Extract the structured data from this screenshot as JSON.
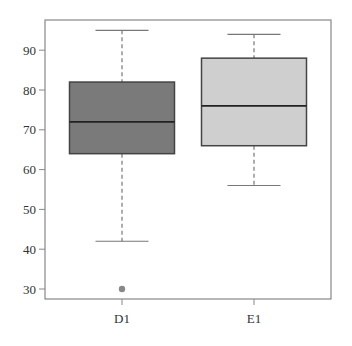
{
  "chart_data": {
    "type": "box",
    "title": "",
    "xlabel": "",
    "ylabel": "",
    "ylim": [
      27.5,
      97
    ],
    "yticks": [
      30,
      40,
      50,
      60,
      70,
      80,
      90
    ],
    "categories": [
      "D1",
      "E1"
    ],
    "series": [
      {
        "name": "D1",
        "whisker_low": 42,
        "q1": 64,
        "median": 72,
        "q3": 82,
        "whisker_high": 95,
        "outliers": [
          30
        ],
        "fill": "#7a7a7a"
      },
      {
        "name": "E1",
        "whisker_low": 56,
        "q1": 66,
        "median": 76,
        "q3": 88,
        "whisker_high": 94,
        "outliers": [],
        "fill": "#cfcfcf"
      }
    ],
    "grid": false,
    "legend": null
  },
  "colors": {
    "frame": "#888888",
    "box_edge": "#444444",
    "whisker": "#777777",
    "outlier": "#888888"
  }
}
